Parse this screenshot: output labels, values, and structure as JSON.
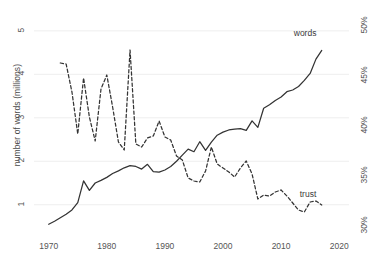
{
  "chart_data": {
    "type": "line",
    "title": "",
    "xlabel": "",
    "ylabel": "number of words (millions)",
    "y2label": "proportion who say \"most people can be trusted\"",
    "xlim": [
      1968.5,
      2021
    ],
    "ylim": [
      0.35,
      5.25
    ],
    "y2lim": [
      29.3,
      50.6
    ],
    "grid": true,
    "legend_position": "inline-end-of-line",
    "xticks": [
      1970,
      1980,
      1990,
      2000,
      2010,
      2020
    ],
    "xticklabels": [
      "1970",
      "1980",
      "1990",
      "2000",
      "2010",
      "2020"
    ],
    "yticks": [
      1,
      2,
      3,
      4,
      5
    ],
    "yticklabels": [
      "1",
      "2",
      "3",
      "4",
      "5"
    ],
    "y2ticks": [
      30,
      35,
      40,
      45,
      50
    ],
    "y2ticklabels": [
      "30%",
      "35%",
      "40%",
      "45%",
      "50%"
    ],
    "series": [
      {
        "name": "words",
        "label": "words",
        "axis": "left",
        "style": "solid",
        "color": "#333333",
        "x": [
          1970,
          1971,
          1972,
          1973,
          1974,
          1975,
          1976,
          1977,
          1978,
          1979,
          1980,
          1981,
          1982,
          1983,
          1984,
          1985,
          1986,
          1987,
          1988,
          1989,
          1990,
          1991,
          1992,
          1993,
          1994,
          1995,
          1996,
          1997,
          1998,
          1999,
          2000,
          2001,
          2002,
          2003,
          2004,
          2005,
          2006,
          2007,
          2008,
          2009,
          2010,
          2011,
          2012,
          2013,
          2014,
          2015,
          2016,
          2017
        ],
        "values": [
          0.55,
          0.62,
          0.7,
          0.78,
          0.88,
          1.05,
          1.55,
          1.33,
          1.5,
          1.56,
          1.63,
          1.72,
          1.78,
          1.85,
          1.9,
          1.88,
          1.82,
          1.93,
          1.76,
          1.75,
          1.8,
          1.88,
          2.0,
          2.14,
          2.28,
          2.22,
          2.45,
          2.25,
          2.44,
          2.6,
          2.67,
          2.72,
          2.74,
          2.75,
          2.71,
          2.93,
          2.78,
          3.22,
          3.3,
          3.4,
          3.48,
          3.6,
          3.64,
          3.72,
          3.86,
          4.02,
          4.35,
          4.55
        ]
      },
      {
        "name": "trust",
        "label": "trust",
        "axis": "right",
        "style": "dashed",
        "color": "#333333",
        "x": [
          1972,
          1973,
          1974,
          1975,
          1976,
          1977,
          1978,
          1979,
          1980,
          1981,
          1982,
          1983,
          1984,
          1985,
          1986,
          1987,
          1988,
          1989,
          1990,
          1991,
          1992,
          1993,
          1994,
          1995,
          1996,
          1997,
          1998,
          1999,
          2000,
          2001,
          2002,
          2003,
          2004,
          2005,
          2006,
          2007,
          2008,
          2009,
          2010,
          2011,
          2012,
          2013,
          2014,
          2015,
          2016,
          2017
        ],
        "values": [
          46.3,
          46.2,
          43.4,
          39.2,
          44.8,
          40.9,
          38.5,
          43.7,
          45.1,
          41.9,
          38.4,
          37.6,
          47.6,
          38.2,
          37.9,
          38.8,
          39.0,
          40.5,
          38.9,
          38.6,
          37.0,
          36.6,
          34.8,
          34.5,
          34.4,
          35.5,
          37.9,
          36.2,
          35.8,
          35.4,
          34.9,
          35.8,
          36.5,
          35.2,
          32.7,
          33.1,
          33.0,
          33.4,
          33.6,
          33.0,
          32.3,
          31.6,
          31.4,
          32.4,
          32.5,
          32.1
        ]
      }
    ],
    "annotations": [
      {
        "name": "words-series-label",
        "text": "words"
      },
      {
        "name": "trust-series-label",
        "text": "trust"
      }
    ]
  },
  "colors": {
    "line": "#333333",
    "grid": "#eeeeee",
    "text": "#4a4a4a",
    "background": "#ffffff"
  }
}
